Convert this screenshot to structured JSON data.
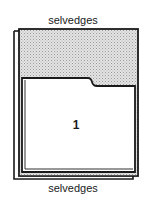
{
  "diagram": {
    "top_label": "selvedges",
    "bottom_label": "selvedges",
    "panel_number": "1",
    "colors": {
      "outline": "#1a1a1a",
      "shaded_fill": "#d6d6d6",
      "background": "#ffffff"
    }
  }
}
